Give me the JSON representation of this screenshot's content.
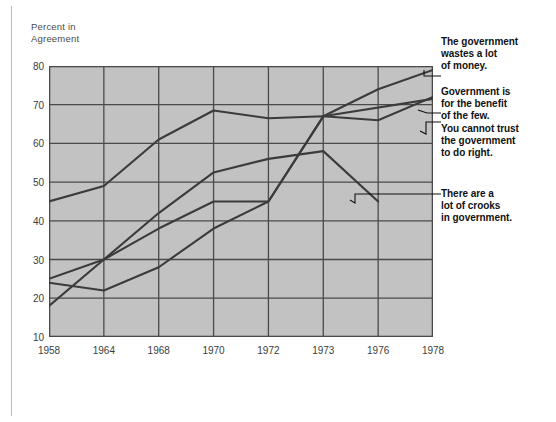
{
  "axis_title": "Percent in\nAgreement",
  "annotations": [
    {
      "id": "wastes",
      "text": "The government\nwastes a lot\nof money.",
      "top": 36,
      "leader_y": 76
    },
    {
      "id": "benefit",
      "text": "Government is\nfor the benefit\nof the few.",
      "top": 86,
      "leader_y": 113
    },
    {
      "id": "trust",
      "text": "You cannot trust\nthe government\nto do right.",
      "top": 123,
      "leader_y": 122
    },
    {
      "id": "crooks",
      "text": "There are a\nlot of crooks\nin government.",
      "top": 188,
      "leader_y": 194
    }
  ],
  "colors": {
    "plot_fill": "#c2c2c2",
    "grid": "#4a4a4a",
    "line": "#3b3b3b",
    "text": "#3c3c3c",
    "anno_text": "#111111",
    "page": "#ffffff"
  },
  "chart_data": {
    "type": "line",
    "title": "",
    "subtitle": "",
    "xlabel": "",
    "ylabel": "Percent in Agreement",
    "categories": [
      "1958",
      "1964",
      "1968",
      "1970",
      "1972",
      "1973",
      "1976",
      "1978"
    ],
    "x_ticks": [
      "1958",
      "1964",
      "1968",
      "1970",
      "1972",
      "1973",
      "1976",
      "1978"
    ],
    "y_ticks": [
      10,
      20,
      30,
      40,
      50,
      60,
      70,
      80
    ],
    "ylim": [
      5,
      80
    ],
    "xlim_ordinal": [
      0,
      7
    ],
    "grid": true,
    "legend": "right-annotations",
    "series": [
      {
        "name": "Government is for the benefit of the few.",
        "x": [
          "1958",
          "1964",
          "1968",
          "1970",
          "1972",
          "1973",
          "1976",
          "1978"
        ],
        "values": [
          45,
          49,
          61,
          68.5,
          66.5,
          67,
          66,
          72
        ]
      },
      {
        "name": "The government wastes a lot of money.",
        "x": [
          "1958",
          "1964",
          "1968",
          "1970",
          "1972",
          "1973",
          "1976",
          "1978"
        ],
        "values": [
          25,
          30,
          38,
          45,
          45,
          67,
          74,
          79
        ]
      },
      {
        "name": "You cannot trust the government to do right.",
        "x": [
          "1958",
          "1964",
          "1968",
          "1970",
          "1972",
          "1973",
          "1978"
        ],
        "values": [
          24,
          22,
          28,
          38,
          45,
          67,
          71.5
        ]
      },
      {
        "name": "There are a lot of crooks in government.",
        "x": [
          "1958",
          "1964",
          "1968",
          "1970",
          "1972",
          "1973",
          "1976"
        ],
        "values": [
          18,
          30,
          42,
          52.5,
          56,
          58,
          45
        ]
      }
    ]
  }
}
